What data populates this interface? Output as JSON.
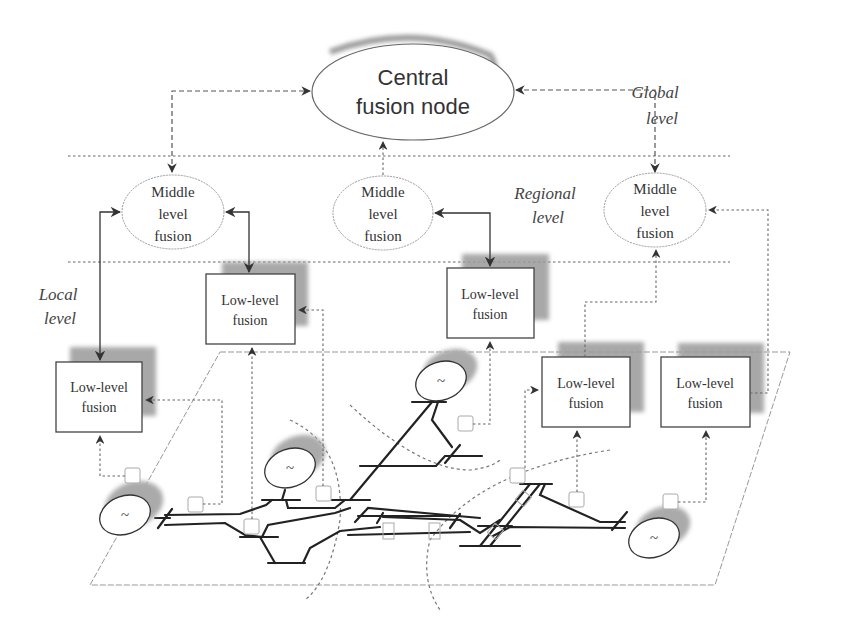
{
  "diagram": {
    "central_node": {
      "line1": "Central",
      "line2": "fusion node"
    },
    "levels": {
      "global": {
        "line1": "Global",
        "line2": "level"
      },
      "regional": {
        "line1": "Regional",
        "line2": "level"
      },
      "local": {
        "line1": "Local",
        "line2": "level"
      }
    },
    "middle_nodes": [
      {
        "line1": "Middle",
        "line2": "level",
        "line3": "fusion"
      },
      {
        "line1": "Middle",
        "line2": "level",
        "line3": "fusion"
      },
      {
        "line1": "Middle",
        "line2": "level",
        "line3": "fusion"
      }
    ],
    "low_nodes": [
      {
        "line1": "Low-level",
        "line2": "fusion"
      },
      {
        "line1": "Low-level",
        "line2": "fusion"
      },
      {
        "line1": "Low-level",
        "line2": "fusion"
      },
      {
        "line1": "Low-level",
        "line2": "fusion"
      },
      {
        "line1": "Low-level",
        "line2": "fusion"
      }
    ],
    "generators": [
      {
        "symbol": "~"
      },
      {
        "symbol": "~"
      },
      {
        "symbol": "~"
      },
      {
        "symbol": "~"
      }
    ]
  }
}
